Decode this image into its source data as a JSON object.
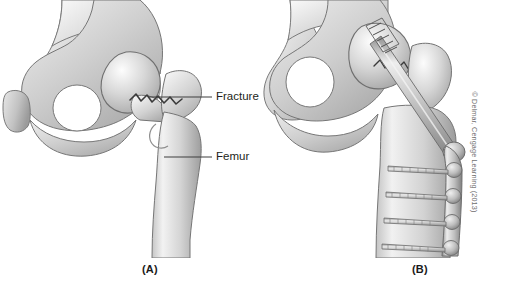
{
  "figure": {
    "background_color": "#ffffff"
  },
  "panels": [
    {
      "id": "A",
      "caption": "(A)",
      "description": "Pelvis and proximal femur showing an intertrochanteric hip fracture",
      "callouts": [
        {
          "name": "fracture",
          "label": "Fracture"
        },
        {
          "name": "femur",
          "label": "Femur"
        }
      ]
    },
    {
      "id": "B",
      "caption": "(B)",
      "description": "Surgical repair with a compression hip screw and side plate fixed by cortical screws",
      "callouts": []
    }
  ],
  "credit": {
    "text": "© Delmar, Cengage Learning (2013)"
  },
  "colors": {
    "bone_light": "#f2f2f2",
    "bone_mid": "#c9c9c9",
    "bone_shadow": "#9a9a9a",
    "outline": "#6b6b6b",
    "metal_light": "#e3e3e3",
    "metal_mid": "#b4b4b4",
    "metal_dark": "#8a8a8a",
    "label_text": "#231f20",
    "credit_text": "#6e6e6e"
  }
}
